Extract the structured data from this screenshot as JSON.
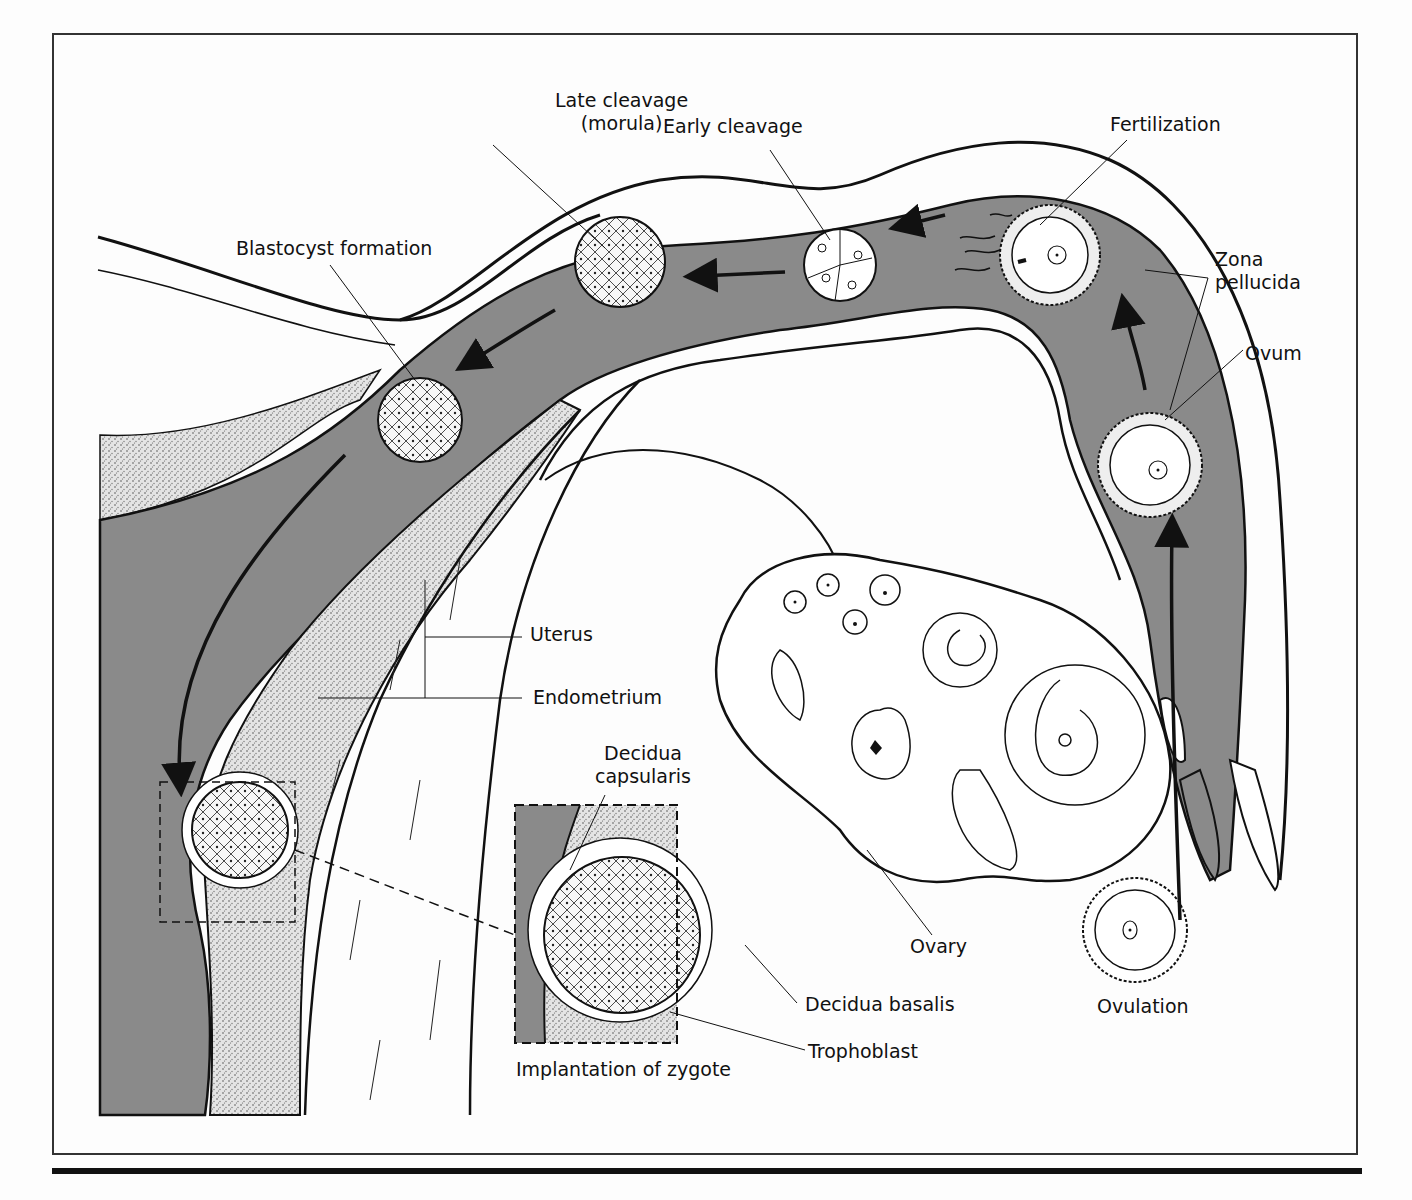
{
  "figure": {
    "colors": {
      "lumen_gray": "#8a8a8a",
      "stipple": "#d9d9d9",
      "line": "#111111",
      "paper": "#fdfdfd"
    }
  },
  "labels": {
    "late_cleavage": "Late cleavage\n(morula)",
    "late_cleavage_l1": "Late cleavage",
    "late_cleavage_l2": "(morula)",
    "early_cleavage": "Early cleavage",
    "fertilization": "Fertilization",
    "blastocyst": "Blastocyst formation",
    "zona_l1": "Zona",
    "zona_l2": "pellucida",
    "ovum": "Ovum",
    "uterus": "Uterus",
    "endometrium": "Endometrium",
    "decidua_cap_l1": "Decidua",
    "decidua_cap_l2": "capsularis",
    "decidua_basalis": "Decidua basalis",
    "trophoblast": "Trophoblast",
    "implantation": "Implantation of zygote",
    "ovary": "Ovary",
    "ovulation": "Ovulation"
  },
  "stages": [
    {
      "id": "ovulation",
      "x": 1135,
      "y": 930
    },
    {
      "id": "ovum",
      "x": 1150,
      "y": 465
    },
    {
      "id": "fertilization",
      "x": 1050,
      "y": 255
    },
    {
      "id": "early_cleavage",
      "x": 840,
      "y": 265
    },
    {
      "id": "morula",
      "x": 620,
      "y": 262
    },
    {
      "id": "blastocyst",
      "x": 420,
      "y": 420
    },
    {
      "id": "implantation",
      "x": 240,
      "y": 830
    }
  ]
}
